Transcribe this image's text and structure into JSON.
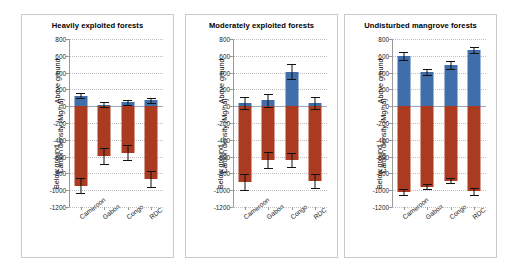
{
  "chart_data": {
    "type": "bar",
    "ylabel": "Carbon density (Mg/ha)",
    "xlabel": "",
    "ylim": [
      -1200,
      800
    ],
    "yticks": [
      800,
      600,
      400,
      200,
      0,
      -200,
      -400,
      -600,
      -800,
      -1000,
      -1200
    ],
    "ytick_labels": [
      "800",
      "600",
      "400",
      "200",
      "0",
      "-200",
      "-400",
      "-600",
      "-800",
      "-1000",
      "-1200"
    ],
    "grid": true,
    "legend": "none",
    "axis_section_labels": [
      "Above ground",
      "Below ground"
    ],
    "categories": [
      "Cameroon",
      "Gabon",
      "Congo",
      "RDC"
    ],
    "series_colors": {
      "above_ground": "#3f6eab",
      "below_ground": "#ab3b20"
    },
    "panels": [
      {
        "title": "Heavily exploited forests",
        "series": [
          {
            "name": "Above ground",
            "values": [
              125,
              20,
              45,
              70
            ],
            "errors": [
              30,
              35,
              28,
              30
            ]
          },
          {
            "name": "Below ground",
            "values": [
              -945,
              -595,
              -555,
              -870
            ],
            "errors": [
              90,
              95,
              90,
              95
            ]
          }
        ]
      },
      {
        "title": "Moderately exploited forests",
        "series": [
          {
            "name": "Above ground",
            "values": [
              40,
              70,
              410,
              40
            ],
            "errors": [
              75,
              75,
              90,
              70
            ]
          },
          {
            "name": "Below ground",
            "values": [
              -900,
              -645,
              -640,
              -890
            ],
            "errors": [
              95,
              95,
              85,
              85
            ]
          }
        ]
      },
      {
        "title": "Undisturbed mangrove forests",
        "series": [
          {
            "name": "Above ground",
            "values": [
              600,
              405,
              490,
              670
            ],
            "errors": [
              45,
              35,
              45,
              40
            ]
          },
          {
            "name": "Below ground",
            "values": [
              -1020,
              -960,
              -890,
              -1015
            ],
            "errors": [
              40,
              30,
              30,
              40
            ]
          }
        ]
      }
    ]
  }
}
